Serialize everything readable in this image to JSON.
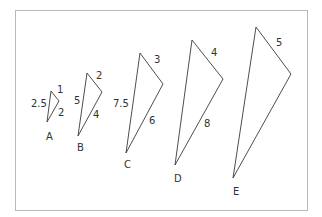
{
  "figure": {
    "frame_color": "#b8b8b8",
    "line_color": "#3a3a3a"
  },
  "triangles": [
    {
      "id": "A",
      "label": "A",
      "sides": {
        "short": "1",
        "middle": "2",
        "long": "2.5"
      },
      "vertices": {
        "top": [
          51,
          91
        ],
        "right": [
          59,
          101
        ],
        "bottom": [
          47,
          122
        ]
      },
      "label_pos": [
        46,
        140
      ],
      "side_label_pos": {
        "short": [
          57,
          93
        ],
        "middle": [
          58,
          116
        ],
        "long": [
          31,
          107
        ]
      }
    },
    {
      "id": "B",
      "label": "B",
      "sides": {
        "short": "2",
        "middle": "4",
        "long": "5"
      },
      "vertices": {
        "top": [
          87,
          73
        ],
        "right": [
          102,
          92
        ],
        "bottom": [
          78,
          136
        ]
      },
      "label_pos": [
        77,
        151
      ],
      "side_label_pos": {
        "short": [
          96,
          79
        ],
        "middle": [
          93,
          118
        ],
        "long": [
          74,
          104
        ]
      }
    },
    {
      "id": "C",
      "label": "C",
      "sides": {
        "short": "3",
        "middle": "6",
        "long": "7.5"
      },
      "vertices": {
        "top": [
          140,
          53
        ],
        "right": [
          163,
          84
        ],
        "bottom": [
          126,
          153
        ]
      },
      "label_pos": [
        124,
        168
      ],
      "side_label_pos": {
        "short": [
          154,
          63
        ],
        "middle": [
          149,
          124
        ],
        "long": [
          113,
          107
        ]
      }
    },
    {
      "id": "D",
      "label": "D",
      "sides": {
        "short": "4",
        "middle": "8"
      },
      "vertices": {
        "top": [
          192,
          40
        ],
        "right": [
          223,
          79
        ],
        "bottom": [
          175,
          165
        ]
      },
      "label_pos": [
        174,
        182
      ],
      "side_label_pos": {
        "short": [
          211,
          56
        ],
        "middle": [
          204,
          127
        ]
      }
    },
    {
      "id": "E",
      "label": "E",
      "sides": {
        "short": "5"
      },
      "vertices": {
        "top": [
          256,
          27
        ],
        "right": [
          291,
          74
        ],
        "bottom": [
          233,
          178
        ]
      },
      "label_pos": [
        233,
        195
      ],
      "side_label_pos": {
        "short": [
          276,
          46
        ]
      }
    }
  ]
}
